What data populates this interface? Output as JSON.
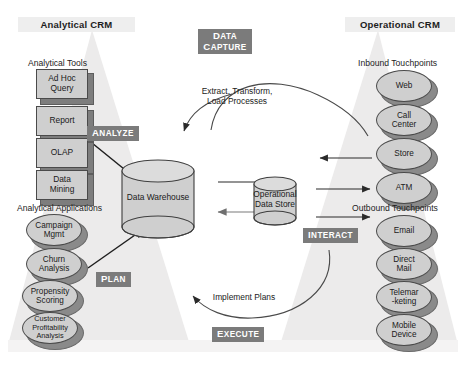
{
  "diagram": {
    "title_left": "Analytical CRM",
    "title_right": "Operational CRM",
    "colors": {
      "badge_bg": "#7b7b7b",
      "badge_text": "#ffffff",
      "shape_fill": "#cfcfcf",
      "shape_stroke": "#4a4a4a",
      "shadow": "#8a8a8a",
      "wedge": "#eceaea",
      "header_band": "#eeeeee",
      "page_bg": "#ffffff"
    }
  },
  "left": {
    "tools_caption": "Analytical Tools",
    "tools": [
      {
        "label": "Ad Hoc\nQuery"
      },
      {
        "label": "Report"
      },
      {
        "label": "OLAP"
      },
      {
        "label": "Data\nMining"
      }
    ],
    "apps_caption": "Analytical Applications",
    "apps": [
      {
        "label": "Campaign\nMgmt"
      },
      {
        "label": "Churn\nAnalysis"
      },
      {
        "label": "Propensity\nScoring"
      },
      {
        "label": "Customer\nProfitability\nAnalysis"
      }
    ]
  },
  "right": {
    "inbound_caption": "Inbound Touchpoints",
    "inbound": [
      {
        "label": "Web"
      },
      {
        "label": "Call\nCenter"
      },
      {
        "label": "Store"
      },
      {
        "label": "ATM"
      }
    ],
    "outbound_caption": "Outbound Touchpoints",
    "outbound": [
      {
        "label": "Email"
      },
      {
        "label": "Direct\nMail"
      },
      {
        "label": "Telemar\n-keting"
      },
      {
        "label": "Mobile\nDevice"
      }
    ]
  },
  "center": {
    "warehouse_label": "Data Warehouse",
    "ods_label": "Operational\nData Store"
  },
  "badges": {
    "data_capture": "DATA CAPTURE",
    "analyze": "ANALYZE",
    "plan": "PLAN",
    "interact": "INTERACT",
    "execute": "EXECUTE"
  },
  "flows": {
    "top_curve_label": "Extract, Transform,\nLoad Processes",
    "bottom_curve_label": "Implement Plans"
  }
}
